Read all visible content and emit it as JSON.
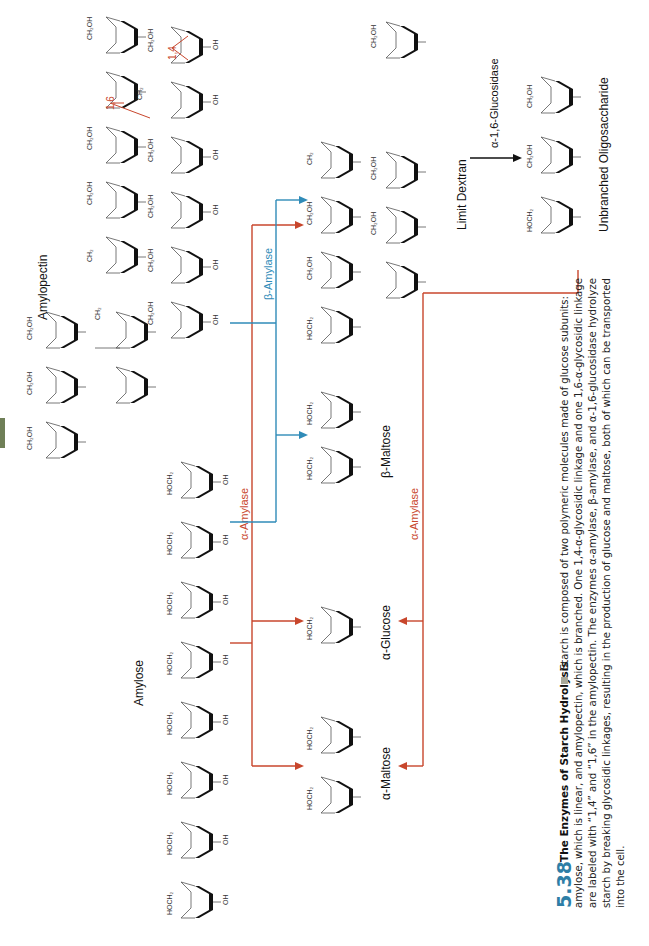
{
  "figure": {
    "number": "5.38",
    "title": "The Enzymes of Starch Hydrolysis",
    "caption_lines": [
      "Starch is composed of two polymeric molecules made of glucose subunits:",
      "amylose, which is linear, and amylopectin, which is branched. One 1,4-α-glycosidic linkage and one 1,6-α-glycosidic linkage",
      "are labeled with “1,4” and “1,6” in the amylopectin. The enzymes α-amylase, β-amylase, and α-1,6-glucosidase hydrolyze",
      "starch by breaking glycosidic linkages, resulting in the production of glucose and maltose, both of which can be transported",
      "into the cell."
    ]
  },
  "labels": {
    "amylopectin": "Amylopectin",
    "amylose": "Amylose",
    "alpha_maltose": "α-Maltose",
    "alpha_glucose": "α-Glucose",
    "beta_maltose": "β-Maltose",
    "limit_dextran": "Limit Dextran",
    "unbranched": "Unbranched Oligosaccharide",
    "link_14": "1,4",
    "link_16": "1,6"
  },
  "enzymes": {
    "alpha_amylase": "α-Amylase",
    "beta_amylase": "β-Amylase",
    "alpha_16_glucosidase": "α-1,6-Glucosidase"
  },
  "atoms": {
    "ch2oh": "CH₂OH",
    "hoch2": "HOCH₂",
    "ch2": "CH₂",
    "oh": "OH",
    "ho": "HO",
    "o": "O",
    "h": "H"
  },
  "colors": {
    "alpha_amylase": "#c8462c",
    "beta_amylase": "#2f8bb8",
    "figure_number": "#2e7ea6",
    "tab": "#6f7f57"
  }
}
